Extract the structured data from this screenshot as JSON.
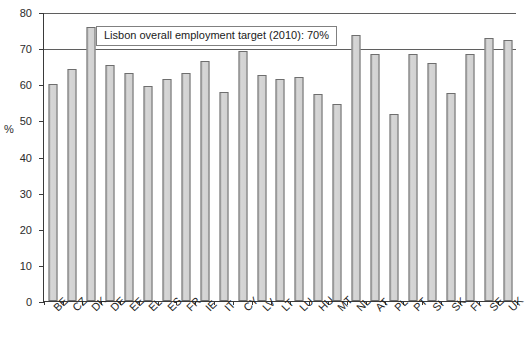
{
  "chart_data": {
    "type": "bar",
    "title": "",
    "subtitle": "",
    "xlabel": "",
    "ylabel": "%",
    "ylim": [
      0,
      80
    ],
    "ytick_step": 10,
    "yticks": [
      0,
      10,
      20,
      30,
      40,
      50,
      60,
      70,
      80
    ],
    "grid": false,
    "legend": "none",
    "categories": [
      "BE",
      "CZ",
      "DK",
      "DE",
      "EE",
      "EL",
      "ES",
      "FR",
      "IE",
      "IT",
      "CY",
      "LV",
      "LT",
      "LU",
      "HU",
      "MT",
      "NL",
      "AT",
      "PL",
      "PT",
      "SI",
      "SK",
      "FI",
      "SE",
      "UK"
    ],
    "values": [
      60.0,
      64.2,
      75.9,
      65.4,
      63.0,
      59.5,
      61.4,
      63.2,
      66.5,
      57.8,
      69.3,
      62.7,
      61.5,
      62.0,
      57.3,
      54.6,
      73.7,
      68.4,
      51.9,
      68.4,
      65.8,
      57.6,
      68.4,
      72.8,
      72.3
    ],
    "reference_lines": [
      {
        "name": "lisbon-target",
        "value": 70,
        "label": "Lisbon overall employment target (2010): 70%"
      }
    ],
    "annotations": [
      {
        "name": "lisbon-target-callout",
        "text": "Lisbon overall employment target (2010): 70%"
      }
    ],
    "colors": {
      "bar_fill": "#cfcfcf",
      "bar_edge": "#6e6e6e",
      "axis": "#3a3a3a",
      "reference_line": "#5f5f5f",
      "text": "#1f1f1f"
    }
  }
}
